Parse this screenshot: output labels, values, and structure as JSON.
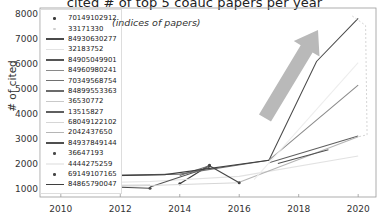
{
  "chart_data": {
    "type": "line",
    "title": "cited # of top 5 coauc papers per year",
    "xlabel": "",
    "ylabel": "# of cited",
    "annotation": "(indices of papers)",
    "xlim": [
      2009.3,
      2020.6
    ],
    "ylim": [
      700,
      8300
    ],
    "xticks": [
      "2010",
      "2012",
      "2014",
      "2016",
      "2018",
      "2020"
    ],
    "xtick_values": [
      2010,
      2012,
      2014,
      2016,
      2018,
      2020
    ],
    "yticks": [
      "1000",
      "2000",
      "3000",
      "4000",
      "5000",
      "6000",
      "7000",
      "8000"
    ],
    "ytick_values": [
      1000,
      2000,
      3000,
      4000,
      5000,
      6000,
      7000,
      8000
    ],
    "grid": false,
    "legend_position": "upper-left",
    "legend_title": "(indices of papers)",
    "series": [
      {
        "name": "70149102912",
        "style": "dot",
        "color": "#3a3a3a",
        "x": [
          2014.0,
          2015.0
        ],
        "y": [
          1230,
          1980
        ]
      },
      {
        "name": "33171330",
        "style": "dot",
        "color": "#cfcfcf",
        "x": [
          2010.0,
          2011.0
        ],
        "y": [
          1060,
          1110
        ]
      },
      {
        "name": "84930630277",
        "style": "line",
        "color": "#4a4a4a",
        "x": [
          2017.0,
          2018.6,
          2020.0
        ],
        "y": [
          2180,
          6150,
          7880
        ]
      },
      {
        "name": "32183752",
        "style": "line",
        "color": "#e2e2e2",
        "x": [
          2010.0,
          2013.0,
          2016.0,
          2020.0
        ],
        "y": [
          1240,
          1320,
          1530,
          2350
        ]
      },
      {
        "name": "84905049901",
        "style": "line",
        "color": "#555555",
        "x": [
          2013.0,
          2015.0
        ],
        "y": [
          1100,
          1900
        ]
      },
      {
        "name": "84960980241",
        "style": "line",
        "color": "#8a8a8a",
        "x": [
          2017.0,
          2020.0
        ],
        "y": [
          2180,
          5200
        ]
      },
      {
        "name": "70349568754",
        "style": "line",
        "color": "#707070",
        "x": [
          2010.0,
          2014.0,
          2017.0
        ],
        "y": [
          1530,
          1620,
          2180
        ]
      },
      {
        "name": "84899553363",
        "style": "line",
        "color": "#6b6b6b",
        "x": [
          2014.0,
          2015.0
        ],
        "y": [
          1560,
          1960
        ]
      },
      {
        "name": "36530772",
        "style": "line",
        "color": "#c9c9c9",
        "x": [
          2010.0,
          2013.0
        ],
        "y": [
          1150,
          1180
        ]
      },
      {
        "name": "13515827",
        "style": "line",
        "color": "#5f5f5f",
        "x": [
          2017.0,
          2020.0
        ],
        "y": [
          2080,
          3150
        ]
      },
      {
        "name": "68049122102",
        "style": "line",
        "color": "#d6d6d6",
        "x": [
          2011.0,
          2016.0
        ],
        "y": [
          1090,
          1270
        ]
      },
      {
        "name": "2042437650",
        "style": "line",
        "color": "#b5b5b5",
        "x": [
          2016.0,
          2020.0
        ],
        "y": [
          1290,
          3120
        ]
      },
      {
        "name": "84937849144",
        "style": "line",
        "color": "#4f4f4f",
        "x": [
          2017.3,
          2019.0
        ],
        "y": [
          2050,
          2600
        ]
      },
      {
        "name": "36647193",
        "style": "dot",
        "color": "#4a4a4a",
        "x": [
          2012.0,
          2013.0
        ],
        "y": [
          1090,
          1050
        ]
      },
      {
        "name": "4444275259",
        "style": "line",
        "color": "#ededed",
        "x": [
          2016.5,
          2020.0
        ],
        "y": [
          1400,
          6100
        ]
      },
      {
        "name": "69149107165",
        "style": "dot",
        "color": "#454545",
        "x": [
          2015.0,
          2016.0
        ],
        "y": [
          1960,
          1270
        ]
      },
      {
        "name": "84865790047",
        "style": "line",
        "color": "#3f3f3f",
        "x": [
          2010.0,
          2013.5,
          2017.0
        ],
        "y": [
          1520,
          1600,
          2180
        ]
      },
      {
        "name": "dashed-drop-2020",
        "style": "dashed",
        "color": "#d0d0d0",
        "x": [
          2019.8,
          2020.25,
          2020.3,
          2020.0
        ],
        "y": [
          7980,
          7600,
          3200,
          3120
        ]
      }
    ],
    "arrow_annotation": {
      "name": "growth-arrow",
      "color": "#b9b9b9",
      "direction": "up-right",
      "tail": [
        265,
        118
      ],
      "head": [
        318,
        30
      ]
    }
  }
}
